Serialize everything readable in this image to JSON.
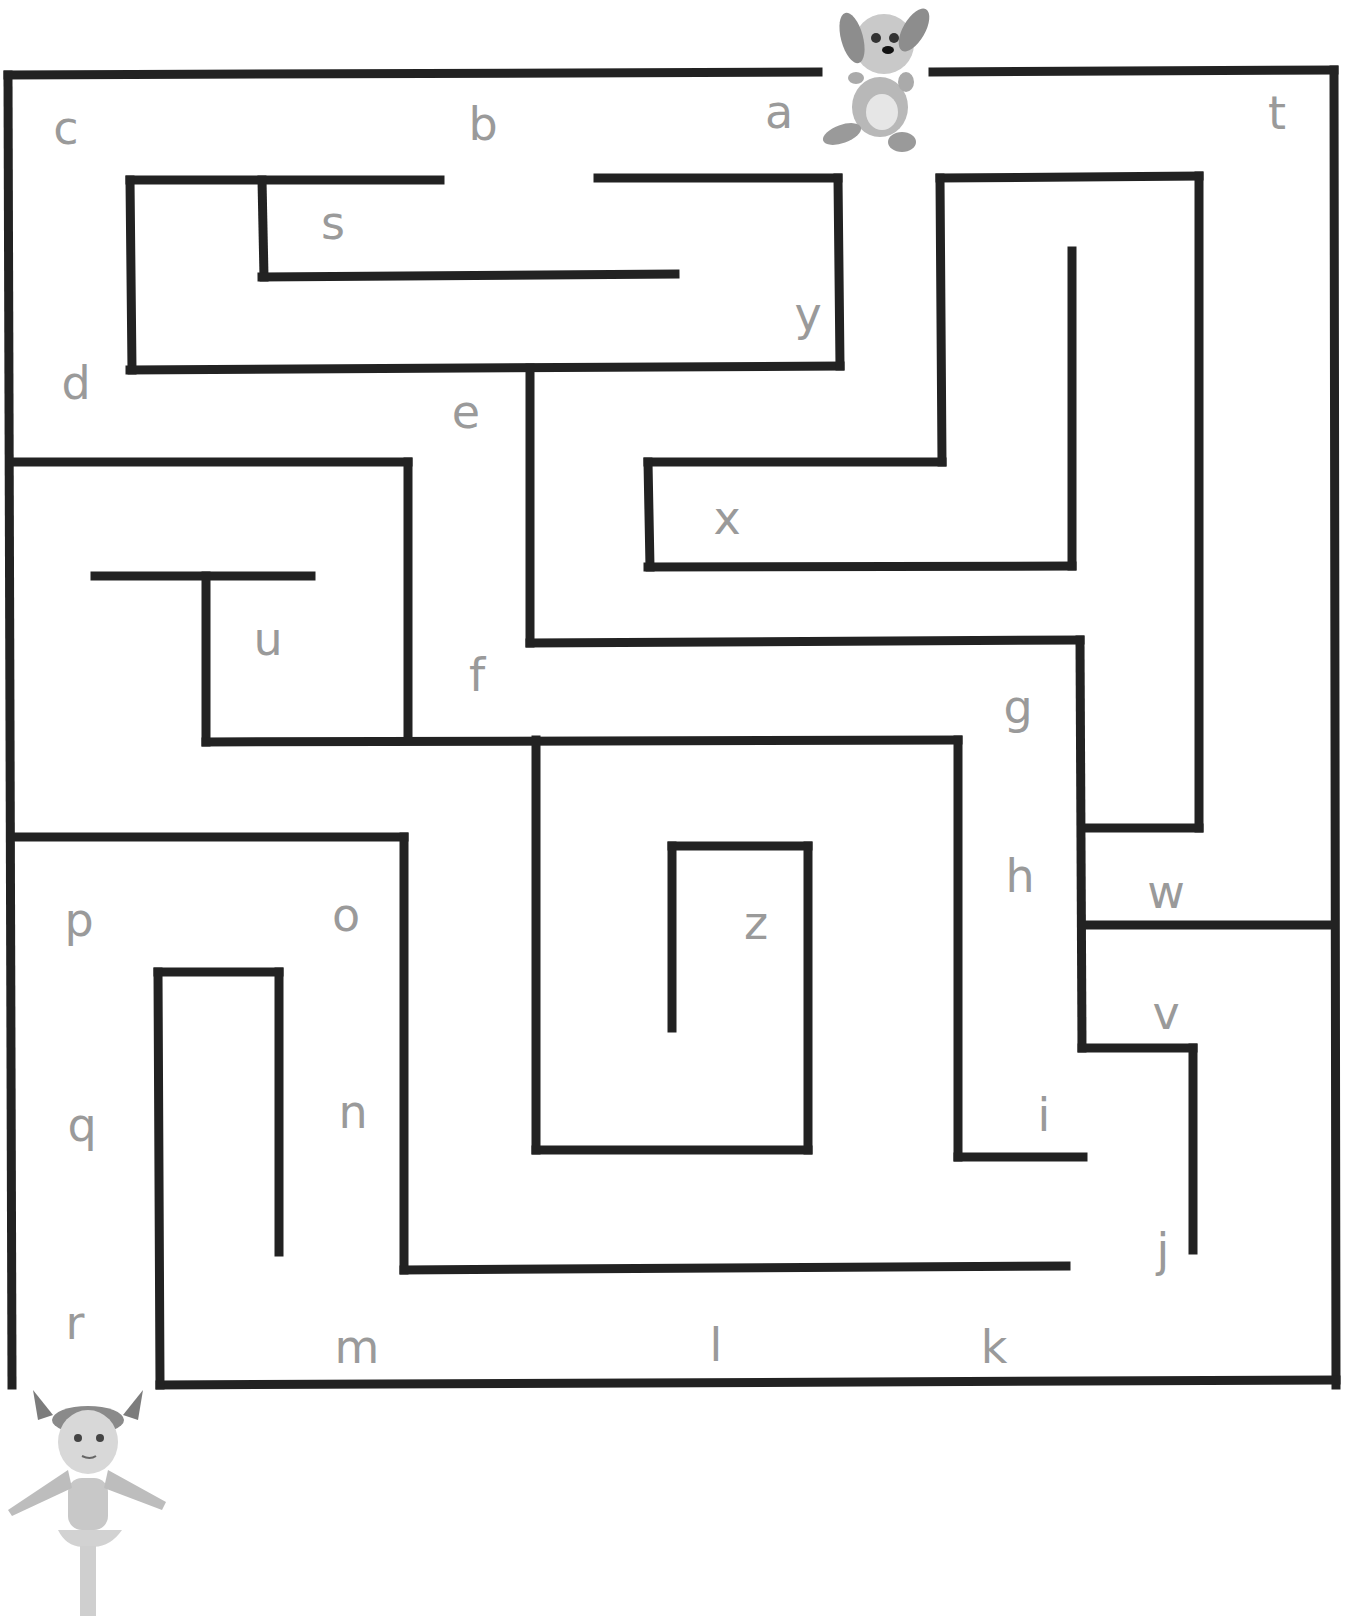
{
  "maze": {
    "wall_color": "#222222",
    "letter_color": "#9a9a9a",
    "wall_width": 9,
    "walls": [
      [
        8,
        75,
        818,
        72
      ],
      [
        933,
        72,
        1334,
        70
      ],
      [
        1334,
        70,
        1336,
        1385
      ],
      [
        8,
        75,
        12,
        1385
      ],
      [
        160,
        1385,
        1336,
        1380
      ],
      [
        130,
        180,
        440,
        180
      ],
      [
        130,
        180,
        132,
        370
      ],
      [
        130,
        370,
        840,
        366
      ],
      [
        262,
        180,
        264,
        277
      ],
      [
        262,
        277,
        675,
        274
      ],
      [
        598,
        178,
        838,
        178
      ],
      [
        838,
        178,
        840,
        366
      ],
      [
        940,
        178,
        1199,
        176
      ],
      [
        940,
        178,
        942,
        462
      ],
      [
        648,
        462,
        942,
        462
      ],
      [
        648,
        462,
        650,
        567
      ],
      [
        648,
        567,
        1072,
        566
      ],
      [
        1072,
        251,
        1072,
        566
      ],
      [
        1199,
        176,
        1199,
        828
      ],
      [
        1082,
        828,
        1199,
        828
      ],
      [
        530,
        368,
        530,
        643
      ],
      [
        530,
        643,
        1080,
        640
      ],
      [
        1080,
        640,
        1082,
        1048
      ],
      [
        1082,
        925,
        1334,
        925
      ],
      [
        1082,
        1048,
        1193,
        1048
      ],
      [
        1193,
        1048,
        1193,
        1250
      ],
      [
        12,
        462,
        408,
        462
      ],
      [
        408,
        462,
        408,
        740
      ],
      [
        95,
        576,
        311,
        576
      ],
      [
        206,
        576,
        206,
        742
      ],
      [
        206,
        742,
        958,
        740
      ],
      [
        958,
        740,
        958,
        1157
      ],
      [
        958,
        1157,
        1083,
        1157
      ],
      [
        536,
        740,
        536,
        1150
      ],
      [
        536,
        1150,
        808,
        1150
      ],
      [
        808,
        846,
        808,
        1150
      ],
      [
        672,
        846,
        808,
        846
      ],
      [
        672,
        846,
        672,
        1028
      ],
      [
        12,
        837,
        404,
        837
      ],
      [
        404,
        837,
        404,
        1270
      ],
      [
        404,
        1270,
        1066,
        1266
      ],
      [
        158,
        972,
        279,
        972
      ],
      [
        158,
        972,
        160,
        1385
      ],
      [
        279,
        972,
        279,
        1252
      ]
    ],
    "letters": [
      {
        "ch": "a",
        "x": 779,
        "y": 112
      },
      {
        "ch": "b",
        "x": 483,
        "y": 124
      },
      {
        "ch": "c",
        "x": 66,
        "y": 128
      },
      {
        "ch": "d",
        "x": 76,
        "y": 383
      },
      {
        "ch": "e",
        "x": 466,
        "y": 412
      },
      {
        "ch": "f",
        "x": 477,
        "y": 675
      },
      {
        "ch": "g",
        "x": 1018,
        "y": 707
      },
      {
        "ch": "h",
        "x": 1020,
        "y": 876
      },
      {
        "ch": "i",
        "x": 1044,
        "y": 1115
      },
      {
        "ch": "j",
        "x": 1163,
        "y": 1250
      },
      {
        "ch": "k",
        "x": 994,
        "y": 1347
      },
      {
        "ch": "l",
        "x": 716,
        "y": 1345
      },
      {
        "ch": "m",
        "x": 357,
        "y": 1347
      },
      {
        "ch": "n",
        "x": 353,
        "y": 1112
      },
      {
        "ch": "o",
        "x": 346,
        "y": 915
      },
      {
        "ch": "p",
        "x": 79,
        "y": 920
      },
      {
        "ch": "q",
        "x": 82,
        "y": 1125
      },
      {
        "ch": "r",
        "x": 75,
        "y": 1323
      },
      {
        "ch": "s",
        "x": 333,
        "y": 223
      },
      {
        "ch": "t",
        "x": 1277,
        "y": 113
      },
      {
        "ch": "u",
        "x": 268,
        "y": 639
      },
      {
        "ch": "v",
        "x": 1166,
        "y": 1013
      },
      {
        "ch": "w",
        "x": 1166,
        "y": 892
      },
      {
        "ch": "x",
        "x": 727,
        "y": 518
      },
      {
        "ch": "y",
        "x": 808,
        "y": 314
      },
      {
        "ch": "z",
        "x": 756,
        "y": 923
      }
    ]
  },
  "characters": {
    "start": {
      "name": "puppy",
      "label": "Puppy at maze entrance"
    },
    "finish": {
      "name": "girl",
      "label": "Girl at maze exit"
    }
  }
}
